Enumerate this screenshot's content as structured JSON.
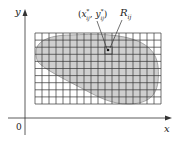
{
  "diagram": {
    "axes": {
      "x_label": "x",
      "y_label": "y",
      "origin_label": "0"
    },
    "grid": {
      "columns": 18,
      "rows": 10,
      "left": 35,
      "top": 33,
      "right": 161,
      "bottom": 104
    },
    "annotations": {
      "sample_point_label": "(x*ij, y*ij)",
      "sample_point_x_main": "x",
      "sample_point_x_sup": "*",
      "sample_point_x_sub": "ij",
      "sample_point_y_main": "y",
      "sample_point_y_sup": "*",
      "sample_point_y_sub": "ij",
      "subrectangle_label_main": "R",
      "subrectangle_label_sub": "ij"
    },
    "colors": {
      "region_fill": "#cfcfcf",
      "grid_line": "#333333",
      "axis": "#333333",
      "background": "#ffffff"
    }
  }
}
